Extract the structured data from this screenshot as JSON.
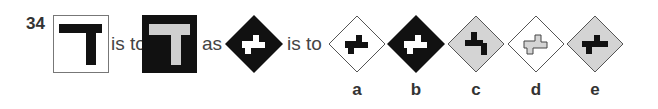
{
  "question": {
    "number": "34",
    "connectors": {
      "is_to_1": "is to",
      "as": "as",
      "is_to_2": "is to"
    }
  },
  "premise": {
    "first": {
      "frame": "square",
      "frame_fill": "#ffffff",
      "frame_border": "#777777",
      "shape": "T",
      "shape_fill": "#111111"
    },
    "second": {
      "frame": "square",
      "frame_fill": "#111111",
      "frame_border": "#111111",
      "shape": "T",
      "shape_fill": "#cfcfcf"
    },
    "third": {
      "frame": "diamond",
      "frame_fill": "#111111",
      "shape": "z-step",
      "shape_fill": "#ffffff"
    }
  },
  "options": [
    {
      "label": "a",
      "frame_fill": "#ffffff",
      "shape_fill": "#111111",
      "shape_variant": "step-right"
    },
    {
      "label": "b",
      "frame_fill": "#111111",
      "shape_fill": "#ffffff",
      "shape_variant": "step-right"
    },
    {
      "label": "c",
      "frame_fill": "#d4d4d4",
      "shape_fill": "#111111",
      "shape_variant": "step-left"
    },
    {
      "label": "d",
      "frame_fill": "#ffffff",
      "shape_fill": "#d4d4d4",
      "shape_variant": "step-right-outline"
    },
    {
      "label": "e",
      "frame_fill": "#d4d4d4",
      "shape_fill": "#111111",
      "shape_variant": "step-right"
    }
  ],
  "colors": {
    "black": "#111111",
    "light_gray": "#d4d4d4",
    "border_gray": "#777777",
    "text": "#333333"
  }
}
